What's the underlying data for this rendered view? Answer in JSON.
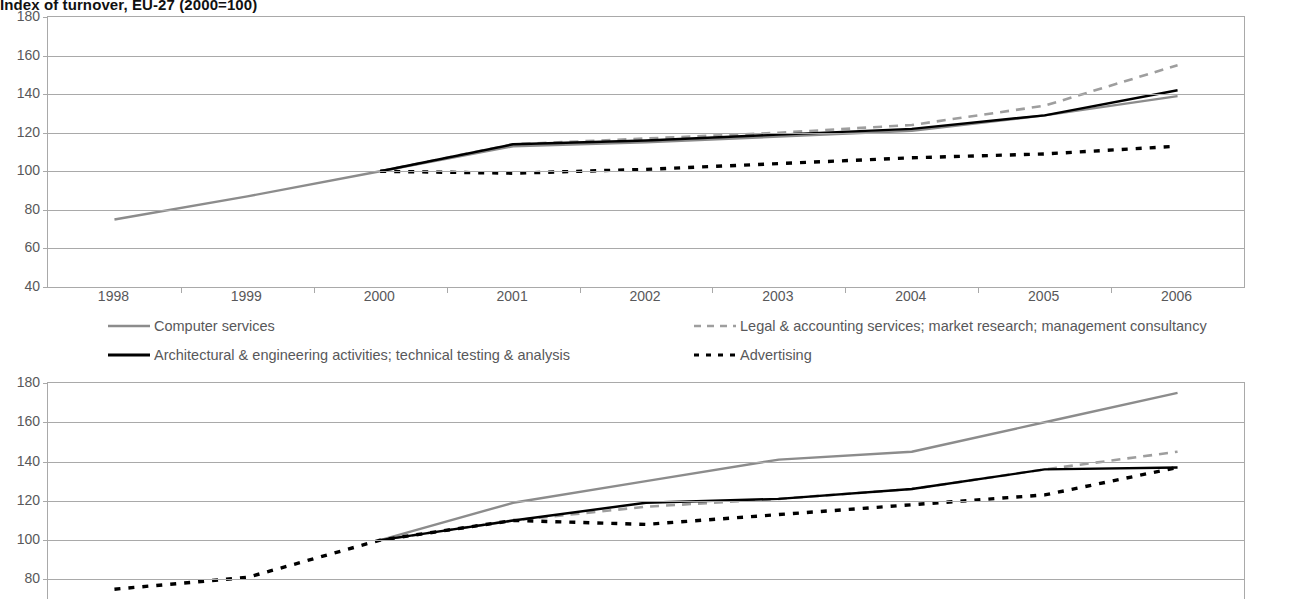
{
  "title": "Index of turnover, EU-27 (2000=100)",
  "legend": {
    "computer": "Computer services",
    "legal": "Legal & accounting services; market research; management consultancy",
    "architectural": "Architectural & engineering activities; technical testing & analysis",
    "advertising": "Advertising"
  },
  "colors": {
    "computer": "#8c8c8c",
    "legal": "#9e9e9e",
    "architectural": "#000000",
    "advertising": "#000000",
    "grid": "#a9a9a9",
    "axis_text": "#58585a",
    "title": "#111111"
  },
  "chart_data": [
    {
      "type": "line",
      "title": "Index of turnover, EU-27 (2000=100)",
      "xlabel": "",
      "ylabel": "",
      "x": [
        "1998",
        "1999",
        "2000",
        "2001",
        "2002",
        "2003",
        "2004",
        "2005",
        "2006"
      ],
      "ylim": [
        40,
        180
      ],
      "yticks": [
        40,
        60,
        80,
        100,
        120,
        140,
        160,
        180
      ],
      "grid": true,
      "legend_position": "below",
      "series": [
        {
          "name": "Computer services",
          "style": "solid",
          "color": "#8c8c8c",
          "values": [
            75,
            87,
            100,
            113,
            115,
            118,
            121,
            129,
            139
          ]
        },
        {
          "name": "Legal & accounting services; market research; management consultancy",
          "style": "dashed",
          "color": "#9e9e9e",
          "values": [
            null,
            null,
            100,
            114,
            117,
            120,
            124,
            134,
            155
          ]
        },
        {
          "name": "Architectural & engineering activities; technical testing & analysis",
          "style": "solid",
          "color": "#000000",
          "values": [
            null,
            null,
            100,
            114,
            116,
            119,
            122,
            129,
            142
          ]
        },
        {
          "name": "Advertising",
          "style": "dotted",
          "color": "#000000",
          "values": [
            null,
            null,
            100,
            99,
            101,
            104,
            107,
            109,
            113
          ]
        }
      ]
    },
    {
      "type": "line",
      "title": "",
      "xlabel": "",
      "ylabel": "",
      "x": [
        "1998",
        "1999",
        "2000",
        "2001",
        "2002",
        "2003",
        "2004",
        "2005",
        "2006"
      ],
      "ylim": [
        70,
        180
      ],
      "yticks": [
        80,
        100,
        120,
        140,
        160,
        180
      ],
      "grid": true,
      "legend_position": "none",
      "series": [
        {
          "name": "Computer services",
          "style": "solid",
          "color": "#8c8c8c",
          "values": [
            null,
            null,
            100,
            119,
            130,
            141,
            145,
            160,
            175
          ]
        },
        {
          "name": "Legal & accounting services; market research; management consultancy",
          "style": "dashed",
          "color": "#9e9e9e",
          "values": [
            null,
            null,
            100,
            110,
            117,
            121,
            126,
            136,
            145
          ]
        },
        {
          "name": "Architectural & engineering activities; technical testing & analysis",
          "style": "solid",
          "color": "#000000",
          "values": [
            null,
            null,
            100,
            110,
            119,
            121,
            126,
            136,
            137
          ]
        },
        {
          "name": "Advertising",
          "style": "dotted",
          "color": "#000000",
          "values": [
            75,
            81,
            100,
            110,
            108,
            113,
            118,
            123,
            137
          ]
        }
      ]
    }
  ]
}
